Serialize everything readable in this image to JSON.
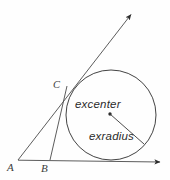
{
  "figure": {
    "kind": "geometry-diagram",
    "background_color": "#fefefe",
    "stroke_color": "#3c3c3c",
    "circle_stroke_color": "#2e2e2e",
    "text_color": "#2b2b2b",
    "vertices": [
      {
        "id": "A",
        "label": "A",
        "x": 18,
        "y": 160
      },
      {
        "id": "B",
        "label": "B",
        "x": 50,
        "y": 160
      },
      {
        "id": "C",
        "label": "C",
        "x": 67,
        "y": 86
      }
    ],
    "annotations": [
      {
        "id": "excenter",
        "label": "excenter",
        "x": 75,
        "y": 99
      },
      {
        "id": "exradius",
        "label": "exradius",
        "x": 89,
        "y": 131
      }
    ],
    "circle": {
      "cx": 111,
      "cy": 115,
      "r": 45
    },
    "excenter_point": {
      "x": 110,
      "y": 114
    },
    "exradius_segment": {
      "x1": 110,
      "y1": 114,
      "x2": 144,
      "y2": 144
    },
    "rays": [
      {
        "id": "ray-AC",
        "from": "A",
        "x1": 18,
        "y1": 160,
        "x2": 133,
        "y2": 12,
        "arrow": "end"
      },
      {
        "id": "ray-AB",
        "from": "A",
        "x1": 18,
        "y1": 160,
        "x2": 163,
        "y2": 162,
        "arrow": "end"
      },
      {
        "id": "segment-BC",
        "from": "B",
        "x1": 50,
        "y1": 160,
        "x2": 67,
        "y2": 86,
        "arrow": "none"
      }
    ]
  }
}
